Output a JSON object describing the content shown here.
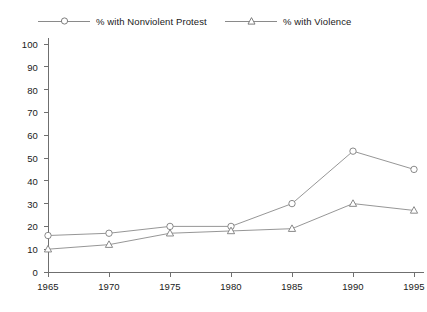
{
  "chart_data": {
    "type": "line",
    "title": "",
    "subtitle": "",
    "xlabel": "",
    "ylabel": "",
    "x": [
      1965,
      1970,
      1975,
      1980,
      1985,
      1990,
      1995
    ],
    "xticklabels": [
      "1965",
      "1970",
      "1975",
      "1980",
      "1985",
      "1990",
      "1995"
    ],
    "yticklabels": [
      "0",
      "10",
      "20",
      "30",
      "40",
      "50",
      "60",
      "70",
      "80",
      "90",
      "100"
    ],
    "yticks": [
      0,
      10,
      20,
      30,
      40,
      50,
      60,
      70,
      80,
      90,
      100
    ],
    "xlim": [
      1965,
      1995
    ],
    "ylim": [
      0,
      100
    ],
    "grid": false,
    "legend_position": "top",
    "series": [
      {
        "name": "% with Nonviolent Protest",
        "marker": "circle-open",
        "color": "#8a8a8a",
        "values": [
          16,
          17,
          20,
          20,
          30,
          53,
          45
        ]
      },
      {
        "name": "% with Violence",
        "marker": "triangle-open",
        "color": "#8a8a8a",
        "values": [
          10,
          12,
          17,
          18,
          19,
          30,
          27
        ]
      }
    ]
  },
  "legend": {
    "entries": [
      {
        "label": "% with Nonviolent Protest",
        "marker": "circle-open"
      },
      {
        "label": "% with Violence",
        "marker": "triangle-open"
      }
    ]
  },
  "caption": {
    "text": ""
  },
  "colors": {
    "line": "#8a8a8a",
    "axis": "#6f6f6f",
    "text": "#1a1a1a",
    "background": "#ffffff"
  }
}
